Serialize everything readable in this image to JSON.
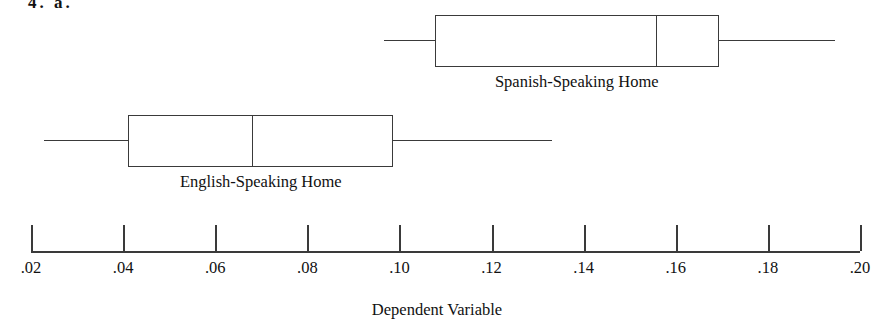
{
  "figure": {
    "caption": "4. a.",
    "width": 874,
    "height": 333,
    "background": "#ffffff",
    "line_color": "#3a3a3a",
    "text_color": "#111111"
  },
  "chart_data": {
    "type": "box",
    "orientation": "horizontal",
    "title": "",
    "xlabel": "Dependent Variable",
    "ylabel": "",
    "xlim": [
      0.02,
      0.2
    ],
    "grid": false,
    "legend": null,
    "xticks": [
      0.02,
      0.04,
      0.06,
      0.08,
      0.1,
      0.12,
      0.14,
      0.16,
      0.18,
      0.2
    ],
    "xticklabels": [
      ".02",
      ".04",
      ".06",
      ".08",
      ".10",
      ".12",
      ".14",
      ".16",
      ".18",
      ".20"
    ],
    "categories": [
      "Spanish-Speaking Home",
      "English-Speaking Home"
    ],
    "boxes": [
      {
        "label": "Spanish-Speaking Home",
        "whisker_low": 0.0967,
        "q1": 0.1077,
        "median": 0.1556,
        "q3": 0.1693,
        "whisker_high": 0.1945,
        "row": 0
      },
      {
        "label": "English-Speaking Home",
        "whisker_low": 0.0228,
        "q1": 0.0411,
        "median": 0.068,
        "q3": 0.0987,
        "whisker_high": 0.1332,
        "row": 1
      }
    ]
  },
  "layout": {
    "axis_left_px": 31,
    "axis_right_px": 860,
    "axis_y_px": 251,
    "tick_height_px": 26,
    "tick_label_y_px": 258,
    "axis_title_y_px": 300,
    "rows": [
      {
        "box_top_px": 15,
        "label_y_px": 72
      },
      {
        "box_top_px": 115,
        "label_y_px": 172
      }
    ]
  }
}
